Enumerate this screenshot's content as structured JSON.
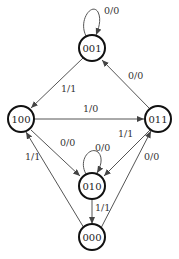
{
  "diagram": {
    "type": "state-transition-diagram",
    "nodes": [
      {
        "id": "001",
        "label": "001"
      },
      {
        "id": "100",
        "label": "100"
      },
      {
        "id": "011",
        "label": "011"
      },
      {
        "id": "010",
        "label": "010"
      },
      {
        "id": "000",
        "label": "000"
      }
    ],
    "edges": [
      {
        "from": "001",
        "to": "001",
        "label": "0/0"
      },
      {
        "from": "001",
        "to": "100",
        "label": "1/1"
      },
      {
        "from": "011",
        "to": "001",
        "label": "0/0"
      },
      {
        "from": "100",
        "to": "011",
        "label": "1/0"
      },
      {
        "from": "100",
        "to": "010",
        "label": "0/0"
      },
      {
        "from": "011",
        "to": "010",
        "label": "1/1"
      },
      {
        "from": "010",
        "to": "010",
        "label": "0/0"
      },
      {
        "from": "000",
        "to": "100",
        "label": "1/1"
      },
      {
        "from": "000",
        "to": "011",
        "label": "0/0"
      },
      {
        "from": "010",
        "to": "000",
        "label": "1/1"
      }
    ]
  }
}
